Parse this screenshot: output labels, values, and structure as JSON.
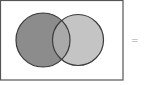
{
  "diagram": {
    "type": "venn",
    "sets": [
      {
        "name": "left-set",
        "color": "#8c8c8c"
      },
      {
        "name": "right-set",
        "color": "#c4c4c4"
      }
    ],
    "intersection_color": "#a9a9a9",
    "border_color": "#4a4a4a",
    "frame_color": "#555555"
  },
  "equals_sign": "="
}
